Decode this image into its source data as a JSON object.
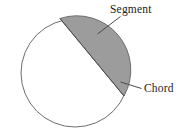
{
  "figure": {
    "canvas": {
      "width": 191,
      "height": 138,
      "background": "#ffffff"
    },
    "circle": {
      "name": "circle-outline",
      "cx": 75,
      "cy": 73,
      "r": 54,
      "fill": "#ffffff",
      "stroke": "#6e6e6e",
      "stroke_width": 1
    },
    "chord": {
      "name": "chord-line",
      "x1": 60,
      "y1": 18.5,
      "x2": 124,
      "y2": 96,
      "stroke": "#4a4a4a",
      "stroke_width": 1
    },
    "segment": {
      "name": "shaded-segment",
      "fill": "#9c9c9c",
      "stroke": "#6e6e6e",
      "description": "minor segment cut off by the chord, upper-right of circle"
    },
    "labels": [
      {
        "id": "segment-label",
        "text": "Segment",
        "x": 110,
        "y": 13,
        "leader": {
          "x1": 120.5,
          "y1": 16.5,
          "x2": 97.5,
          "y2": 34
        }
      },
      {
        "id": "chord-label",
        "text": "Chord",
        "x": 144,
        "y": 92,
        "leader": {
          "x1": 141.5,
          "y1": 88.5,
          "x2": 120.5,
          "y2": 82
        }
      }
    ]
  }
}
